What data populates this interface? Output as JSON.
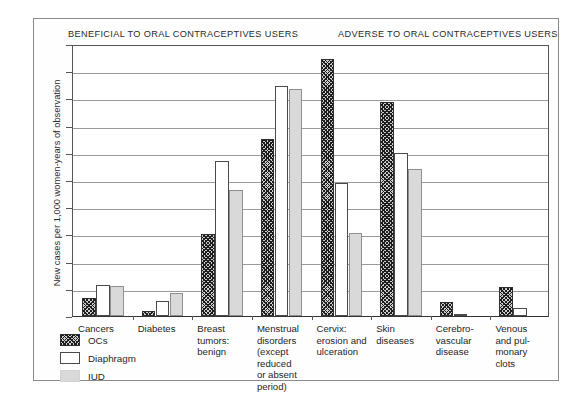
{
  "headers": {
    "beneficial": "BENEFICIAL TO ORAL CONTRACEPTIVES USERS",
    "adverse": "ADVERSE TO ORAL CONTRACEPTIVES USERS"
  },
  "chart_data": {
    "type": "bar",
    "title": "",
    "xlabel": "",
    "ylabel": "New cases per 1,000 women-years of observation",
    "ylim": [
      0,
      10
    ],
    "yticks": [
      0,
      1,
      2,
      3,
      4,
      5,
      6,
      7,
      8,
      9,
      10
    ],
    "grid": true,
    "legend_position": "bottom-left",
    "categories": [
      "Cancers",
      "Diabetes",
      "Breast tumors: benign",
      "Menstrual disorders (except reduced or absent period)",
      "Cervix: erosion and ulceration",
      "Skin diseases",
      "Cerebro-vascular disease",
      "Venous and pul-monary clots"
    ],
    "category_label_lines": [
      [
        "Cancers"
      ],
      [
        "Diabetes"
      ],
      [
        "Breast",
        "tumors:",
        "benign"
      ],
      [
        "Menstrual",
        "disorders",
        "(except",
        "reduced",
        "or absent",
        "period)"
      ],
      [
        "Cervix:",
        "erosion and",
        "ulceration"
      ],
      [
        "Skin",
        "diseases"
      ],
      [
        "Cerebro-",
        "vascular",
        "disease"
      ],
      [
        "Venous",
        "and pul-",
        "monary",
        "clots"
      ]
    ],
    "series": [
      {
        "name": "OCs",
        "values": [
          0.65,
          0.2,
          3.0,
          6.5,
          9.45,
          7.85,
          0.5,
          1.05
        ]
      },
      {
        "name": "Diaphragm",
        "values": [
          1.15,
          0.55,
          5.7,
          8.45,
          4.9,
          6.0,
          0.07,
          0.3
        ]
      },
      {
        "name": "IUD",
        "values": [
          1.1,
          0.85,
          4.65,
          8.35,
          3.05,
          5.4,
          0.0,
          0.0
        ]
      }
    ],
    "annotations": {
      "beneficial_groups": [
        "Cancers",
        "Diabetes",
        "Breast tumors: benign",
        "Menstrual disorders (except reduced or absent period)"
      ],
      "adverse_groups": [
        "Cervix: erosion and ulceration",
        "Skin diseases",
        "Cerebro-vascular disease",
        "Venous and pulmonary clots"
      ]
    }
  },
  "legend": {
    "items": [
      {
        "label": "OCs",
        "swatch": "hatched-dark"
      },
      {
        "label": "Diaphragm",
        "swatch": "white-outline"
      },
      {
        "label": "IUD",
        "swatch": "light-gray"
      }
    ]
  }
}
